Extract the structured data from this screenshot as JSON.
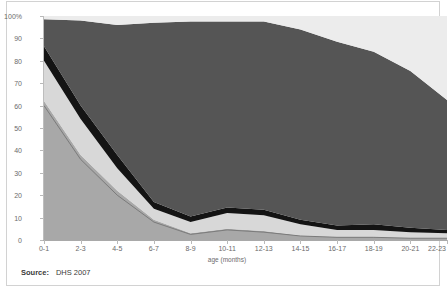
{
  "title": "",
  "source": {
    "label": "Source:",
    "value": "DHS 2007"
  },
  "axes": {
    "y": {
      "label": "",
      "ticks": [
        "100%",
        "90",
        "80",
        "70",
        "60",
        "50",
        "40",
        "30",
        "20",
        "10",
        "0"
      ],
      "values": [
        100,
        90,
        80,
        70,
        60,
        50,
        40,
        30,
        20,
        10,
        0
      ],
      "min": 0,
      "max": 100
    },
    "x": {
      "label": "age (months)",
      "ticks": [
        "0-1",
        "2-3",
        "4-5",
        "6-7",
        "8-9",
        "10-11",
        "12-13",
        "14-15",
        "16-17",
        "18-19",
        "20-21",
        "22-23"
      ]
    }
  },
  "colors": {
    "band_bottom_medium_gray": "#a8a8a8",
    "band_light_gray": "#d8d8d8",
    "band_black": "#141414",
    "band_dark_gray": "#555555",
    "band_top_near_white": "#ececec",
    "trend_line": "#6e6e6e",
    "axis": "#b9b9b9",
    "text": "#6b6b6b",
    "frame": "#d2d2d2"
  },
  "chart_data": {
    "type": "area",
    "stacked": true,
    "title": "",
    "xlabel": "age (months)",
    "ylabel": "",
    "ylim": [
      0,
      100
    ],
    "grid": false,
    "legend": "none",
    "categories": [
      "0-1",
      "2-3",
      "4-5",
      "6-7",
      "8-9",
      "10-11",
      "12-13",
      "14-15",
      "16-17",
      "18-19",
      "20-21",
      "22-23"
    ],
    "series": [
      {
        "name": "exclusively breastfed",
        "color": "#a8a8a8",
        "values": [
          62,
          38,
          22,
          9,
          3,
          5,
          4,
          2,
          1.5,
          1.5,
          1,
          1
        ]
      },
      {
        "name": "breastfed and plain water only",
        "color": "#d8d8d8",
        "values": [
          18,
          16,
          10,
          5,
          5,
          7,
          7,
          5,
          3,
          3,
          2.5,
          2
        ]
      },
      {
        "name": "breastfed and non-milk liquids",
        "color": "#141414",
        "values": [
          6.5,
          6,
          6,
          3,
          2.5,
          2.5,
          2.5,
          2,
          2,
          2.5,
          2,
          1.5
        ]
      },
      {
        "name": "breastfed and complementary foods",
        "color": "#555555",
        "values": [
          12,
          38,
          58,
          80,
          87,
          83,
          84,
          85,
          82,
          77,
          70,
          58
        ]
      },
      {
        "name": "not breastfed",
        "color": "#ececec",
        "values": [
          1.5,
          2,
          4,
          3,
          2.5,
          2.5,
          2.5,
          6,
          11.5,
          16,
          24.5,
          37.5
        ]
      }
    ],
    "cumulative_tops": {
      "exclusive": [
        62,
        38,
        22,
        9,
        3,
        5,
        4,
        2,
        1.5,
        1.5,
        1,
        1
      ],
      "plus_water": [
        80,
        54,
        32,
        14,
        8,
        12,
        11,
        7,
        4.5,
        4.5,
        3.5,
        3
      ],
      "plus_liquids": [
        86.5,
        60,
        38,
        17,
        10.5,
        14.5,
        13.5,
        9,
        6.5,
        7,
        5.5,
        4.5
      ],
      "plus_complementary": [
        98.5,
        98,
        96,
        97,
        97.5,
        97.5,
        97.5,
        94,
        88.5,
        84,
        75.5,
        62.5
      ]
    },
    "inner_trend_line": {
      "name": "exclusive breastfeeding trend",
      "color": "#6e6e6e",
      "values": [
        60,
        36,
        20,
        8,
        2.5,
        4.5,
        3.5,
        1.8,
        1.2,
        1.2,
        0.8,
        0.8
      ]
    }
  }
}
